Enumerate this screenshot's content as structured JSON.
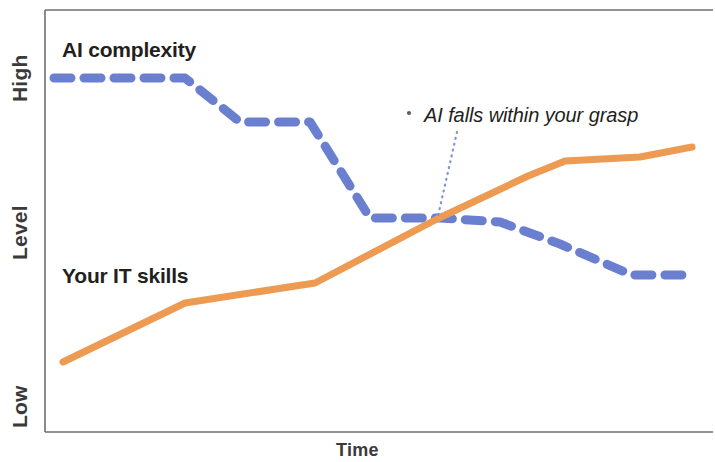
{
  "chart_data": {
    "type": "line",
    "title": "",
    "subtitle": "",
    "xlabel": "Time",
    "ylabel": "Level",
    "xlim": [
      0,
      100
    ],
    "ylim": [
      0,
      100
    ],
    "grid": false,
    "legend_position": "inline-annotations",
    "x_tick_labels": [],
    "y_tick_labels": [
      "Low",
      "High"
    ],
    "series": [
      {
        "name": "AI complexity",
        "color": "#6B7FD0",
        "style": "dashed",
        "label_position": "upper-left",
        "x": [
          3,
          23,
          32,
          47,
          51,
          62,
          73,
          82,
          92,
          100
        ],
        "y": [
          90,
          90,
          79,
          79,
          56,
          56,
          54,
          44,
          34,
          34
        ],
        "points_px": [
          [
            54,
            78
          ],
          [
            185,
            78
          ],
          [
            240,
            122
          ],
          [
            310,
            122
          ],
          [
            370,
            218
          ],
          [
            440,
            218
          ],
          [
            500,
            222
          ],
          [
            560,
            244
          ],
          [
            632,
            275
          ],
          [
            692,
            275
          ]
        ]
      },
      {
        "name": "Your IT skills",
        "color": "#ED9A52",
        "style": "solid",
        "label_position": "lower-left",
        "x": [
          4,
          22,
          42,
          63,
          81,
          88,
          100
        ],
        "y": [
          17,
          31,
          36,
          47,
          59,
          73,
          77
        ],
        "points_px": [
          [
            63,
            362
          ],
          [
            185,
            303
          ],
          [
            315,
            283
          ],
          [
            437,
            219
          ],
          [
            528,
            176
          ],
          [
            565,
            161
          ],
          [
            640,
            157
          ],
          [
            692,
            147
          ]
        ]
      }
    ],
    "annotations": [
      {
        "text": "AI falls within your grasp",
        "style": "italic",
        "color": "#231f20",
        "leader_line": {
          "style": "dotted",
          "color": "#7E93D8",
          "from_px": [
            457,
            132
          ],
          "to_px": [
            438,
            216
          ]
        },
        "position_px": [
          424,
          105
        ]
      }
    ],
    "axis_color": "#5a5a5a",
    "plot_area_px": {
      "left": 45,
      "top": 10,
      "right": 713,
      "bottom": 432
    }
  },
  "axes": {
    "y": {
      "title": "Level",
      "tick_high": "High",
      "tick_low": "Low"
    },
    "x": {
      "title": "Time"
    }
  },
  "series_labels": {
    "ai_complexity": "AI complexity",
    "it_skills": "Your IT skills"
  },
  "annotation": {
    "text": "AI falls within your grasp"
  },
  "colors": {
    "ai_complexity": "#6B7FD0",
    "it_skills": "#ED9A52",
    "leader": "#7E93D8",
    "axis": "#5a5a5a",
    "text": "#231f20"
  }
}
